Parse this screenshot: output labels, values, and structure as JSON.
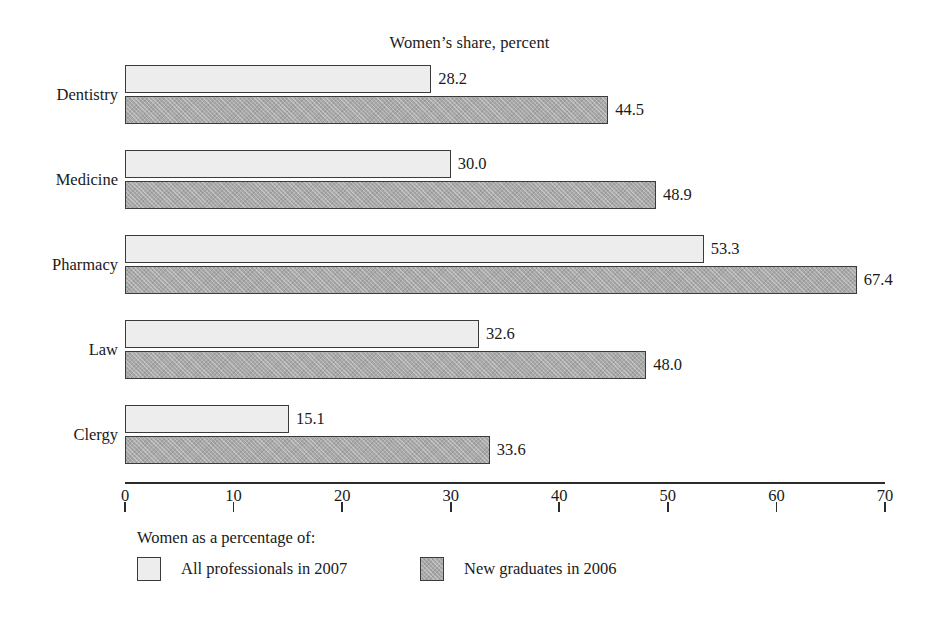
{
  "chart_data": {
    "type": "bar",
    "orientation": "horizontal",
    "title": "Women’s share, percent",
    "xlabel": "",
    "ylabel": "",
    "xlim": [
      0,
      70
    ],
    "xticks": [
      0,
      10,
      20,
      30,
      40,
      50,
      60,
      70
    ],
    "xtick_labels": [
      "0",
      "10",
      "20",
      "30",
      "40",
      "50",
      "60",
      "70"
    ],
    "grid": false,
    "legend_position": "bottom-left",
    "legend_title": "Women as a percentage of:",
    "categories": [
      "Dentistry",
      "Medicine",
      "Pharmacy",
      "Law",
      "Clergy"
    ],
    "series": [
      {
        "name": "All professionals in 2007",
        "color": "#ededed",
        "values": [
          28.2,
          30.0,
          53.3,
          32.6,
          15.1
        ],
        "value_labels": [
          "28.2",
          "30.0",
          "53.3",
          "32.6",
          "15.1"
        ]
      },
      {
        "name": "New graduates in 2006",
        "color": "#a9a9a9",
        "values": [
          44.5,
          48.9,
          67.4,
          48.0,
          33.6
        ],
        "value_labels": [
          "44.5",
          "48.9",
          "67.4",
          "48.0",
          "33.6"
        ]
      }
    ]
  },
  "colors": {
    "series_light": "#ededed",
    "series_dark": "#a9a9a9",
    "bar_border": "#3b3b3b",
    "axis": "#2b2b2b",
    "text": "#1a1a1a",
    "background": "#ffffff"
  }
}
